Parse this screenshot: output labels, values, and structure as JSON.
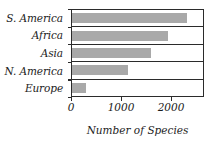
{
  "chart_data": {
    "type": "bar",
    "orientation": "horizontal",
    "title": "",
    "xlabel": "Number of Species",
    "ylabel": "",
    "categories": [
      "S. America",
      "Africa",
      "Asia",
      "N. America",
      "Europe"
    ],
    "values": [
      2300,
      1920,
      1580,
      1120,
      270
    ],
    "series": [
      {
        "name": "Number of Species",
        "values": [
          2300,
          1920,
          1580,
          1120,
          270
        ]
      }
    ],
    "xlim": [
      0,
      2660
    ],
    "xticks": [
      0,
      1000,
      2000
    ],
    "xticklabels": [
      "0",
      "1000",
      "2000"
    ],
    "grid": false,
    "legend": null,
    "bar_color": "#a9a9a9",
    "frame_color": "#2b2b2b"
  }
}
